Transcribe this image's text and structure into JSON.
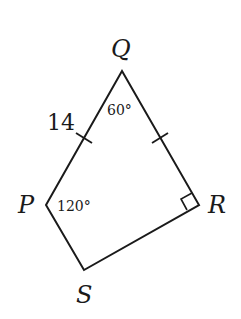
{
  "figure": {
    "type": "quadrilateral",
    "name": "PQRS",
    "stroke_color": "#1a1a1a",
    "background": "#ffffff",
    "vertices": {
      "Q": {
        "label": "Q",
        "x": 122,
        "y": 71
      },
      "P": {
        "label": "P",
        "x": 46,
        "y": 205
      },
      "R": {
        "label": "R",
        "x": 199,
        "y": 205
      },
      "S": {
        "label": "S",
        "x": 84,
        "y": 270
      }
    },
    "side_labels": {
      "PQ": "14"
    },
    "angle_labels": {
      "Q": "60°",
      "P": "120°"
    },
    "right_angle_at": "R",
    "congruent_ticks": [
      "PQ",
      "QR"
    ]
  }
}
